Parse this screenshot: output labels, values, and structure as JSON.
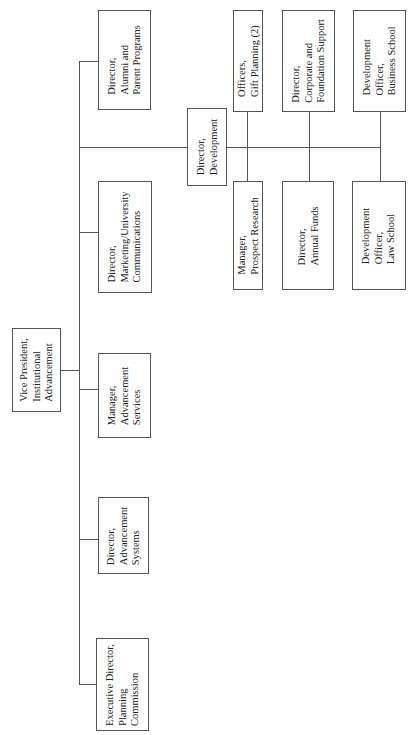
{
  "chart": {
    "orientation": "rotated-90-ccw",
    "root": {
      "lines": [
        "Vice President,",
        "Institutional",
        "Advancement"
      ]
    },
    "direct_reports": [
      {
        "id": "exec",
        "lines": [
          "Executive Director,",
          "Planning",
          "Commission"
        ]
      },
      {
        "id": "advsys",
        "lines": [
          "Director,",
          "Advancement",
          "Systems"
        ]
      },
      {
        "id": "advsvc",
        "lines": [
          "Manager,",
          "Advancement",
          "Services"
        ]
      },
      {
        "id": "mktg",
        "lines": [
          "Director,",
          "Marketing/University",
          "Communications"
        ]
      },
      {
        "id": "dev",
        "lines": [
          "Director,",
          "Development"
        ]
      },
      {
        "id": "alumni",
        "lines": [
          "Director,",
          "Alumni and",
          "Parent Programs"
        ]
      }
    ],
    "development_reports": [
      {
        "id": "gift",
        "lines": [
          "Officers,",
          "Gift Planning (2)"
        ]
      },
      {
        "id": "corp",
        "lines": [
          "Director,",
          "Corporate and",
          "Foundation Support"
        ]
      },
      {
        "id": "bus",
        "lines": [
          "Development",
          "Officer,",
          "Business School"
        ]
      },
      {
        "id": "prospect",
        "lines": [
          "Manager,",
          "Prospect Research"
        ]
      },
      {
        "id": "annual",
        "lines": [
          "Director,",
          "Annual Funds"
        ]
      },
      {
        "id": "law",
        "lines": [
          "Development",
          "Officer,",
          "Law School"
        ]
      }
    ]
  }
}
